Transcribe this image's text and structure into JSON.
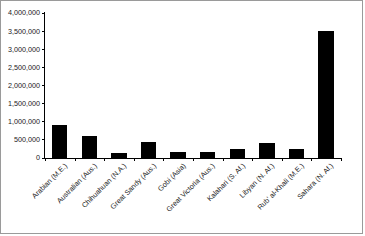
{
  "chart_data": {
    "type": "bar",
    "title": "",
    "subtitle": "",
    "xlabel": "",
    "ylabel": "",
    "categories": [
      "Arabian (M.E.)",
      "Australian (Aus.)",
      "Chihuahuan (N.A.)",
      "Great Sandy (Aus.)",
      "Gobi (Asia)",
      "Great Victoria (Aus.)",
      "Kalahari (S. Af.)",
      "Libyan (N. Af.)",
      "Rub' al-Khali (M.E.)",
      "Sahara (N. Af.)"
    ],
    "values": [
      900000,
      620000,
      140000,
      440000,
      160000,
      170000,
      260000,
      420000,
      250000,
      3500000
    ],
    "ylim": [
      0,
      4000000
    ],
    "ytick_values": [
      0,
      500000,
      1000000,
      1500000,
      2000000,
      2500000,
      3000000,
      3500000,
      4000000
    ],
    "ytick_labels": [
      "0",
      "500,000",
      "1,000,000",
      "1,500,000",
      "2,000,000",
      "2,500,000",
      "3,000,000",
      "3,500,000",
      "4,000,000"
    ],
    "grid": false,
    "legend": false,
    "legend_position": "none",
    "series": [
      {
        "name": "Desert area (sq km)",
        "color": "#000000",
        "values": [
          900000,
          620000,
          140000,
          440000,
          160000,
          170000,
          260000,
          420000,
          250000,
          3500000
        ]
      }
    ],
    "annotations": [],
    "colors": {
      "bar": "#000000",
      "axis": "#000000",
      "text": "#1a1a1a",
      "background": "#ffffff",
      "border": "#9a9a9a"
    },
    "xlabel_rotation": "-45"
  }
}
